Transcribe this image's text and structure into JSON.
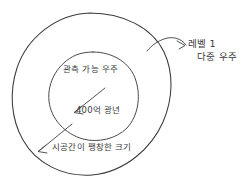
{
  "diagram": {
    "background_color": "#ffffff",
    "ink_color": "#3a3a3c",
    "shapes": {
      "outer_circle": {
        "name": "expanded-spacetime-boundary",
        "center_x": 90,
        "center_y": 94,
        "radius": 81
      },
      "inner_circle": {
        "name": "observable-universe-boundary",
        "center_x": 93,
        "center_y": 96,
        "radius": 45
      }
    },
    "labels": {
      "observable_universe": "관측 가능 우주",
      "light_years": "400억 광년",
      "expansion_size": "시공간이 팽창한 크기",
      "multiverse_line1": "레벨 1",
      "multiverse_line2": "다중 우주"
    },
    "annotations": {
      "radius_arrow": "inner-radius-arrow",
      "expansion_arrow": "outer-radius-arrow",
      "callout_arrow": "multiverse-callout-arrow"
    }
  }
}
